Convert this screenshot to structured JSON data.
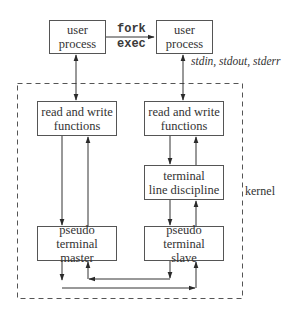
{
  "diagram": {
    "type": "pseudo-terminal architecture",
    "boxes": {
      "user_process_left": {
        "line1": "user",
        "line2": "process"
      },
      "user_process_right": {
        "line1": "user",
        "line2": "process"
      },
      "rw_functions_left": {
        "line1": "read and write",
        "line2": "functions"
      },
      "rw_functions_right": {
        "line1": "read and write",
        "line2": "functions"
      },
      "line_discipline": {
        "line1": "terminal",
        "line2": "line discipline"
      },
      "pty_master": {
        "line1": "pseudo terminal",
        "line2": "master"
      },
      "pty_slave": {
        "line1": "pseudo terminal",
        "line2": "slave"
      }
    },
    "labels": {
      "fork": "fork",
      "exec": "exec",
      "std_streams": "stdin, stdout, stderr",
      "kernel": "kernel"
    },
    "edges": [
      {
        "from": "user_process_left",
        "to": "user_process_right",
        "label": "fork exec",
        "direction": "forward"
      },
      {
        "from": "user_process_left",
        "to": "rw_functions_left",
        "direction": "both"
      },
      {
        "from": "user_process_right",
        "to": "rw_functions_right",
        "direction": "both",
        "label": "stdin, stdout, stderr"
      },
      {
        "from": "rw_functions_left",
        "to": "pty_master",
        "direction": "forward"
      },
      {
        "from": "pty_master",
        "to": "rw_functions_left",
        "direction": "forward"
      },
      {
        "from": "rw_functions_right",
        "to": "line_discipline",
        "direction": "forward"
      },
      {
        "from": "line_discipline",
        "to": "rw_functions_right",
        "direction": "forward"
      },
      {
        "from": "line_discipline",
        "to": "pty_slave",
        "direction": "forward"
      },
      {
        "from": "pty_slave",
        "to": "line_discipline",
        "direction": "forward"
      },
      {
        "from": "pty_master",
        "to": "pty_slave",
        "direction": "forward"
      },
      {
        "from": "pty_slave",
        "to": "pty_master",
        "direction": "forward"
      }
    ],
    "groups": [
      {
        "name": "kernel",
        "members": [
          "rw_functions_left",
          "rw_functions_right",
          "line_discipline",
          "pty_master",
          "pty_slave"
        ],
        "style": "dashed"
      }
    ]
  }
}
